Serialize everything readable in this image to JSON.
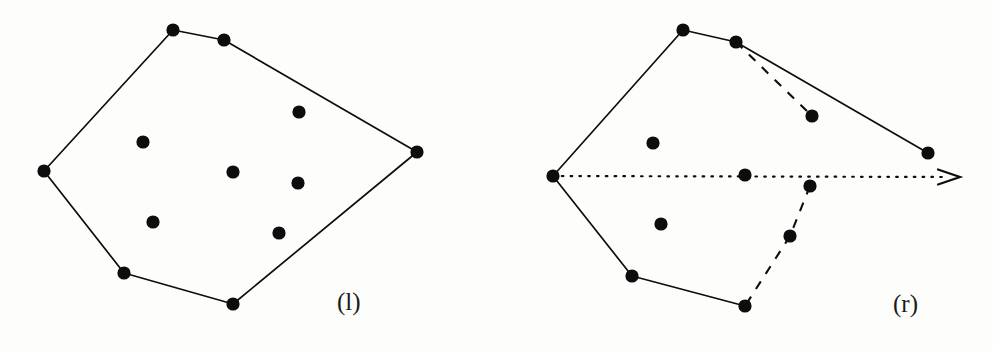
{
  "figure": {
    "background_color": "#fdfdfb",
    "ink_color": "#0d0d0d",
    "width": 993,
    "height": 351
  },
  "panels": [
    {
      "id": "left",
      "label": "(l)",
      "label_position": {
        "x": 337,
        "y": 288
      },
      "hull_vertices": [
        {
          "x": 173,
          "y": 30
        },
        {
          "x": 224,
          "y": 40
        },
        {
          "x": 417,
          "y": 152
        },
        {
          "x": 233,
          "y": 304
        },
        {
          "x": 124,
          "y": 273
        },
        {
          "x": 44,
          "y": 171
        }
      ],
      "interior_points": [
        {
          "x": 143,
          "y": 142
        },
        {
          "x": 299,
          "y": 112
        },
        {
          "x": 233,
          "y": 172
        },
        {
          "x": 298,
          "y": 183
        },
        {
          "x": 153,
          "y": 222
        },
        {
          "x": 279,
          "y": 233
        }
      ],
      "solid_edges": [
        [
          {
            "x": 173,
            "y": 30
          },
          {
            "x": 224,
            "y": 40
          }
        ],
        [
          {
            "x": 224,
            "y": 40
          },
          {
            "x": 417,
            "y": 152
          }
        ],
        [
          {
            "x": 417,
            "y": 152
          },
          {
            "x": 233,
            "y": 304
          }
        ],
        [
          {
            "x": 233,
            "y": 304
          },
          {
            "x": 124,
            "y": 273
          }
        ],
        [
          {
            "x": 124,
            "y": 273
          },
          {
            "x": 44,
            "y": 171
          }
        ],
        [
          {
            "x": 44,
            "y": 171
          },
          {
            "x": 173,
            "y": 30
          }
        ]
      ],
      "dashed_edges": [],
      "ray": null
    },
    {
      "id": "right",
      "label": "(r)",
      "label_position": {
        "x": 893,
        "y": 290
      },
      "hull_vertices": [
        {
          "x": 683,
          "y": 30
        },
        {
          "x": 736,
          "y": 42
        },
        {
          "x": 928,
          "y": 153
        },
        {
          "x": 745,
          "y": 306
        },
        {
          "x": 632,
          "y": 276
        },
        {
          "x": 553,
          "y": 176
        }
      ],
      "interior_points": [
        {
          "x": 653,
          "y": 143
        },
        {
          "x": 812,
          "y": 116
        },
        {
          "x": 745,
          "y": 175
        },
        {
          "x": 810,
          "y": 186
        },
        {
          "x": 661,
          "y": 224
        },
        {
          "x": 790,
          "y": 236
        }
      ],
      "solid_edges": [
        [
          {
            "x": 683,
            "y": 30
          },
          {
            "x": 736,
            "y": 42
          }
        ],
        [
          {
            "x": 736,
            "y": 42
          },
          {
            "x": 928,
            "y": 153
          }
        ],
        [
          {
            "x": 745,
            "y": 306
          },
          {
            "x": 632,
            "y": 276
          }
        ],
        [
          {
            "x": 632,
            "y": 276
          },
          {
            "x": 553,
            "y": 176
          }
        ],
        [
          {
            "x": 553,
            "y": 176
          },
          {
            "x": 683,
            "y": 30
          }
        ]
      ],
      "dashed_edges": [
        [
          {
            "x": 736,
            "y": 42
          },
          {
            "x": 812,
            "y": 116
          }
        ],
        [
          {
            "x": 810,
            "y": 186
          },
          {
            "x": 790,
            "y": 236
          }
        ],
        [
          {
            "x": 790,
            "y": 236
          },
          {
            "x": 745,
            "y": 306
          }
        ]
      ],
      "ray": {
        "from": {
          "x": 553,
          "y": 176
        },
        "to": {
          "x": 960,
          "y": 177
        },
        "style": "dotted",
        "arrowhead": true
      }
    }
  ]
}
